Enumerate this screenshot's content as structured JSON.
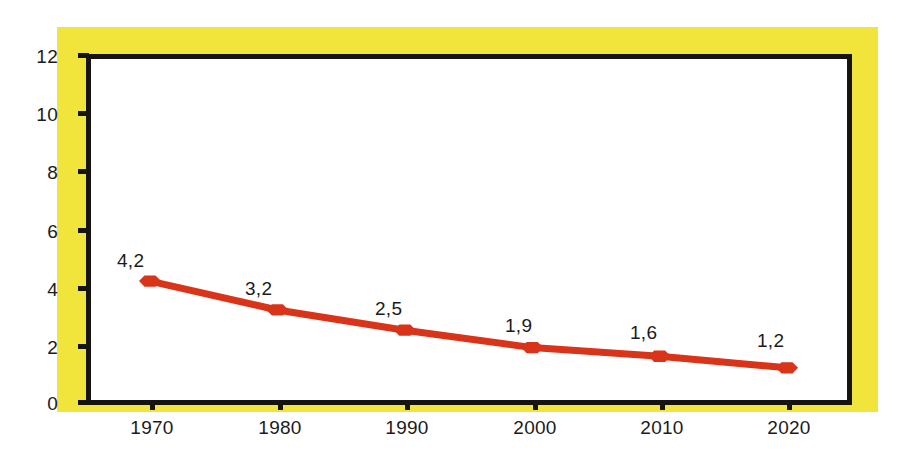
{
  "chart_data": {
    "type": "line",
    "title": "",
    "subtitle": "",
    "xlabel": "",
    "ylabel": "",
    "categories": [
      "1970",
      "1980",
      "1990",
      "2000",
      "2010",
      "2020"
    ],
    "x": [
      1970,
      1980,
      1990,
      2000,
      2010,
      2020
    ],
    "values": [
      4.2,
      3.2,
      2.5,
      1.9,
      1.6,
      1.2
    ],
    "point_labels": [
      "4,2",
      "3,2",
      "2,5",
      "1,9",
      "1,6",
      "1,2"
    ],
    "series": [
      {
        "name": "",
        "values": [
          4.2,
          3.2,
          2.5,
          1.9,
          1.6,
          1.2
        ],
        "color": "#D93319",
        "marker": "hexagon"
      }
    ],
    "xlim": [
      1965,
      2025
    ],
    "ylim": [
      0,
      12
    ],
    "y_ticks": [
      "0",
      "2",
      "4",
      "6",
      "8",
      "10",
      "12"
    ],
    "y_tick_values": [
      0,
      2,
      4,
      6,
      8,
      10,
      12
    ],
    "x_ticks": [
      "1970",
      "1980",
      "1990",
      "2000",
      "2010",
      "2020"
    ],
    "grid": false,
    "legend": null,
    "legend_position": "none",
    "decimal_separator": ",",
    "annotations": []
  },
  "style": {
    "background_color": "#FFFFFF",
    "mat_color": "#F1E53B",
    "frame_color": "#161410",
    "plot_background": "#FFFFFF",
    "series_color": "#D93319",
    "text_color": "#1B1B1B"
  },
  "axes": {
    "y_tick_labels": [
      "12",
      "10",
      "8",
      "6",
      "4",
      "2",
      "0"
    ],
    "x_tick_labels": [
      "1970",
      "1980",
      "1990",
      "2000",
      "2010",
      "2020"
    ]
  }
}
